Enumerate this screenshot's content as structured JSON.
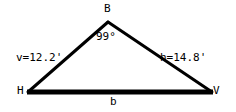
{
  "diagram": {
    "type": "triangle",
    "background_color": "#ffffff",
    "stroke_color": "#000000",
    "text_color": "#000000",
    "vertices": {
      "apex": {
        "name": "B",
        "label": "B",
        "x": 108,
        "y": 22
      },
      "bottom_left": {
        "name": "H",
        "label": "H",
        "x": 28,
        "y": 92
      },
      "bottom_right": {
        "name": "V",
        "label": "V",
        "x": 212,
        "y": 92
      }
    },
    "angles": [
      {
        "at_vertex": "B",
        "label": "99°",
        "value": 99,
        "unit": "degrees"
      }
    ],
    "sides": [
      {
        "name": "left-side",
        "from": "H",
        "to": "B",
        "label": "v=12.2'",
        "variable": "v",
        "value": 12.2,
        "unit": "feet",
        "stroke_width": 3
      },
      {
        "name": "right-side",
        "from": "B",
        "to": "V",
        "label": "h=14.8'",
        "variable": "h",
        "value": 14.8,
        "unit": "feet",
        "stroke_width": 3
      },
      {
        "name": "base",
        "from": "H",
        "to": "V",
        "label": "b",
        "variable": "b",
        "value": null,
        "unit": "feet",
        "stroke_width": 5
      }
    ]
  }
}
